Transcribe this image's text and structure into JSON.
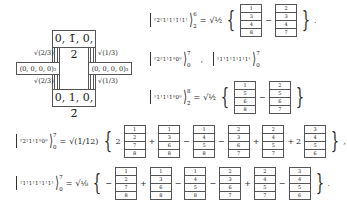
{
  "diagram": {
    "top_box": "0, 1̄, 0, 2",
    "bottom_box": "0, 1, 0, 2̄",
    "left_box": "(0, 0, 0, 0)₂",
    "right_box": "(0, 0, 0, 0)₃",
    "left_top_label": "√(2/3)",
    "left_bottom_label": "√(2/3)",
    "right_top_label": "√(1/3)",
    "right_bottom_label": "√(1/3)"
  },
  "equations": [
    {
      "ket_label": "²2²1¹1¹1¹1¹",
      "sup": "6",
      "sub": "2",
      "coef": "√½",
      "terms": [
        {
          "sign": "",
          "mult": "",
          "cells": [
            "1",
            "3",
            "4",
            "8"
          ]
        },
        {
          "sign": "−",
          "mult": "",
          "cells": [
            "2",
            "3",
            "4",
            "7"
          ]
        }
      ],
      "end": "."
    },
    {
      "ket_label": "²2²1¹1⁰0⁰",
      "sup": "7",
      "sub": "0",
      "separator": ",",
      "ket2_label": "¹1¹1¹1¹1¹1¹",
      "sup2": "7",
      "sub2": "0"
    },
    {
      "ket_label": "¹1¹1¹1⁰0⁰",
      "sup": "8",
      "sub": "2̄",
      "coef": "√½",
      "terms": [
        {
          "sign": "",
          "mult": "",
          "cells": [
            "1",
            "5",
            "6",
            "8"
          ]
        },
        {
          "sign": "−",
          "mult": "",
          "cells": [
            "2",
            "5",
            "6",
            "7"
          ]
        }
      ],
      "end": ""
    },
    {
      "ket_label": "²2²1¹1⁰0⁰",
      "sup": "7",
      "sub": "0",
      "coef": "√(1/12)",
      "terms": [
        {
          "sign": "",
          "mult": "2",
          "cells": [
            "1",
            "2",
            "7",
            "8"
          ]
        },
        {
          "sign": "+",
          "mult": "",
          "cells": [
            "1",
            "3",
            "6",
            "8"
          ]
        },
        {
          "sign": "−",
          "mult": "",
          "cells": [
            "1",
            "4",
            "5",
            "8"
          ]
        },
        {
          "sign": "−",
          "mult": "",
          "cells": [
            "2",
            "3",
            "6",
            "7"
          ]
        },
        {
          "sign": "+",
          "mult": "",
          "cells": [
            "2",
            "4",
            "5",
            "7"
          ]
        },
        {
          "sign": "+",
          "mult": "2",
          "cells": [
            "3",
            "4",
            "5",
            "6"
          ]
        }
      ],
      "end": ","
    },
    {
      "ket_label": "¹1¹1¹1¹1¹1¹",
      "sup": "7",
      "sub": "0",
      "coef": "√⅛",
      "terms": [
        {
          "sign": "−",
          "mult": "",
          "cells": [
            "1",
            "2",
            "7",
            "8"
          ]
        },
        {
          "sign": "+",
          "mult": "",
          "cells": [
            "1",
            "3",
            "6",
            "8"
          ]
        },
        {
          "sign": "−",
          "mult": "",
          "cells": [
            "1",
            "4",
            "5",
            "8"
          ]
        },
        {
          "sign": "−",
          "mult": "",
          "cells": [
            "2",
            "3",
            "6",
            "7"
          ]
        },
        {
          "sign": "+",
          "mult": "",
          "cells": [
            "2",
            "4",
            "5",
            "7"
          ]
        },
        {
          "sign": "−",
          "mult": "",
          "cells": [
            "3",
            "4",
            "5",
            "6"
          ]
        }
      ],
      "end": "."
    }
  ],
  "symbols": {
    "equals": "=",
    "lbrace": "{",
    "rbrace": "}"
  }
}
